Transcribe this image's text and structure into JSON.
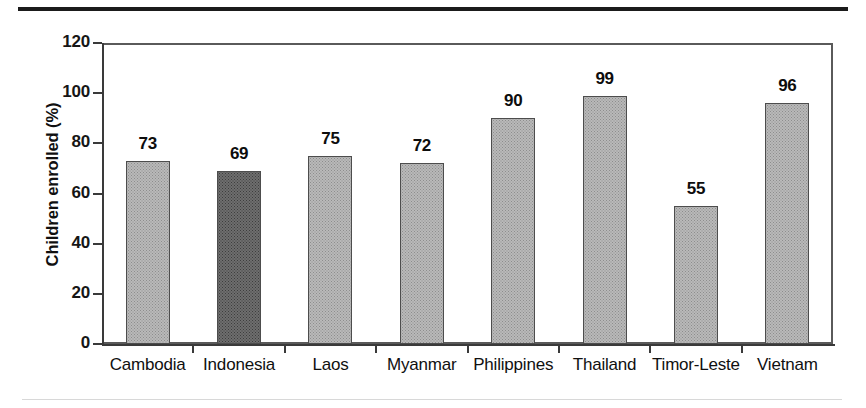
{
  "chart_data": {
    "type": "bar",
    "title": "",
    "xlabel": "",
    "ylabel": "Children enrolled (%)",
    "ylim": [
      0,
      120
    ],
    "ytick_labels": [
      "120",
      "100",
      "80",
      "60",
      "40",
      "20",
      "0"
    ],
    "ytick_values": [
      120,
      100,
      80,
      60,
      40,
      20,
      0
    ],
    "grid": false,
    "legend": false,
    "categories": [
      "Cambodia",
      "Indonesia",
      "Laos",
      "Myanmar",
      "Philippines",
      "Thailand",
      "Timor-Leste",
      "Vietnam"
    ],
    "values": [
      73,
      69,
      75,
      72,
      90,
      99,
      55,
      96
    ],
    "value_labels": [
      "73",
      "69",
      "75",
      "72",
      "90",
      "99",
      "55",
      "96"
    ],
    "highlighted_category": "Indonesia",
    "bar_fill_color": "#b9b9b9",
    "bar_highlight_color": "#6e6e6e",
    "bar_edge_color": "#4d4d4d",
    "axis_color": "#3a3a3a",
    "text_color": "#101010",
    "background_color": "#ffffff"
  },
  "decorations": {
    "top_rule_color": "#1b1b1b",
    "bottom_rule_color": "#d8d8d8"
  }
}
